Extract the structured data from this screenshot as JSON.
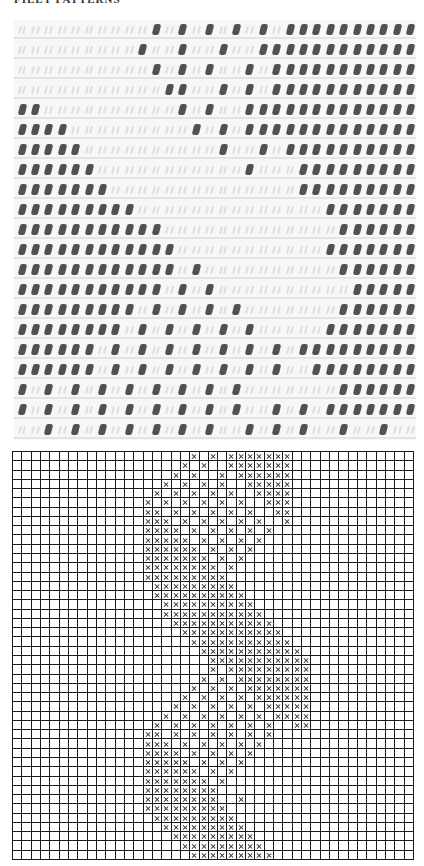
{
  "header": {
    "title": "FILET PATTERNS"
  },
  "photo": {
    "description": "filet crochet swatch photo",
    "rows": [
      "..........O.O.O.O.O.OOOOOOOOOO",
      ".........O..O..O..OOOOOOOOOOOO",
      "..........O.O.O..O.OOOOOOOOOOO",
      "...........OO..O.O.OOOOOOOOOOO",
      "OO..........O.O..OOOOOOOOOOOOO",
      "OOOO.........O.O.OOOOOOOOOOOOO",
      "OOOOO..........O..O.OOOOOOOOOO",
      "OOOOOO...........O...OOOOOOOOO",
      "OOOOOOO..............OOOOOOOOO",
      "OOOOOOOOO..............OOOOOOO",
      "OOOOOOOOOOO.............OOOOOO",
      "OOOOOOOOOOOO...........OOOOOOO",
      "OOOOOOOOOOOO.O..........OOOOOO",
      "OOOOOOOOOOO.O.O..........OOOOO",
      "OOOOOOOOO.O.O.O.O.......OOOOOO",
      "OOOOOOOO.O.O.O.O.O.....OOOOOOO",
      "OOOOOO.O.O.O.O.O.O.O.OOOOOOOOO",
      "OOOOOO.O.O.O.O.O.O.O..OOOOOOOO",
      "O.O.O.O.O.O.O.O.O.......OOOOOO",
      "O.O.O.O.O.O.O.O.O..O.O.OOOOOOO",
      "..O.O.O.O.O.O.O..O.O.O..O..O.."
    ]
  },
  "chart": {
    "columns": 43,
    "rows_count": 44,
    "legend": {
      "filled_symbol": "X",
      "empty_symbol": "."
    },
    "rows": [
      "...................X.X.XXXXXXX.............",
      "..................X.X..XXXXXXX.............",
      ".................X.X..X.XXXXXX.............",
      "................X.X.X.X..XXXXX.............",
      "...............X.X.X.X.X..XXXX.............",
      "..............X.X.X.X.X.X..XXX.............",
      "..............XX.X.X.X.X.X..XX.............",
      "..............XXX.X.X.X.X.X..X.............",
      "..............XXXX.X.X.X.X.X...............",
      "..............XXXXX.X.X.X.X................",
      "..............XXXXXX.X.X.X.................",
      "..............XXXXXXX.X.X..................",
      "..............XXXXXXXX.X...................",
      "..............XXXXXXXXX....................",
      "...............XXXXXXXXX...................",
      "...............XXXXXXXXXX..................",
      "................XXXXXXXXXX.................",
      "................XXXXXXXXXXX................",
      ".................XXXXXXXXXXX...............",
      "..................XXXXXXXXXXX..............",
      "...................XXXXXXXXXXX.............",
      "....................XXXXXXXXXXX............",
      ".....................XXXXXXXXXXX...........",
      ".....................X.XXXXXXXXX...........",
      "....................X.X.XXXXXXXX...........",
      "...................X.X.X.XXXXXXX...........",
      "..................X.X.X.X.XXXXXX...........",
      ".................X.X.X.X.X.XXXXX...........",
      "................X.X.X.X.X.X.XXXX...........",
      "...............X.X.X.X.X.X.X..XX...........",
      "..............XX.X.X.X.X.X.X...............",
      "..............XXX.X.X.X.X.X................",
      "..............XXXX.X.X.X.X.................",
      "..............XXXXX.X.X.X..................",
      "..............XXXXXX.X.X...................",
      "..............XXXXXXX.X....................",
      "..............XXXXXXXX.....................",
      "..............XXXXXXXX..X..................",
      "..............XXXXXXXXX....................",
      "...............XXXXXXXXX...................",
      "................XXXXXXXXX..................",
      ".................XXXXXXXXX.................",
      "..................XXXXXXXXX................",
      "...................XXXXXXXXX..............."
    ]
  }
}
